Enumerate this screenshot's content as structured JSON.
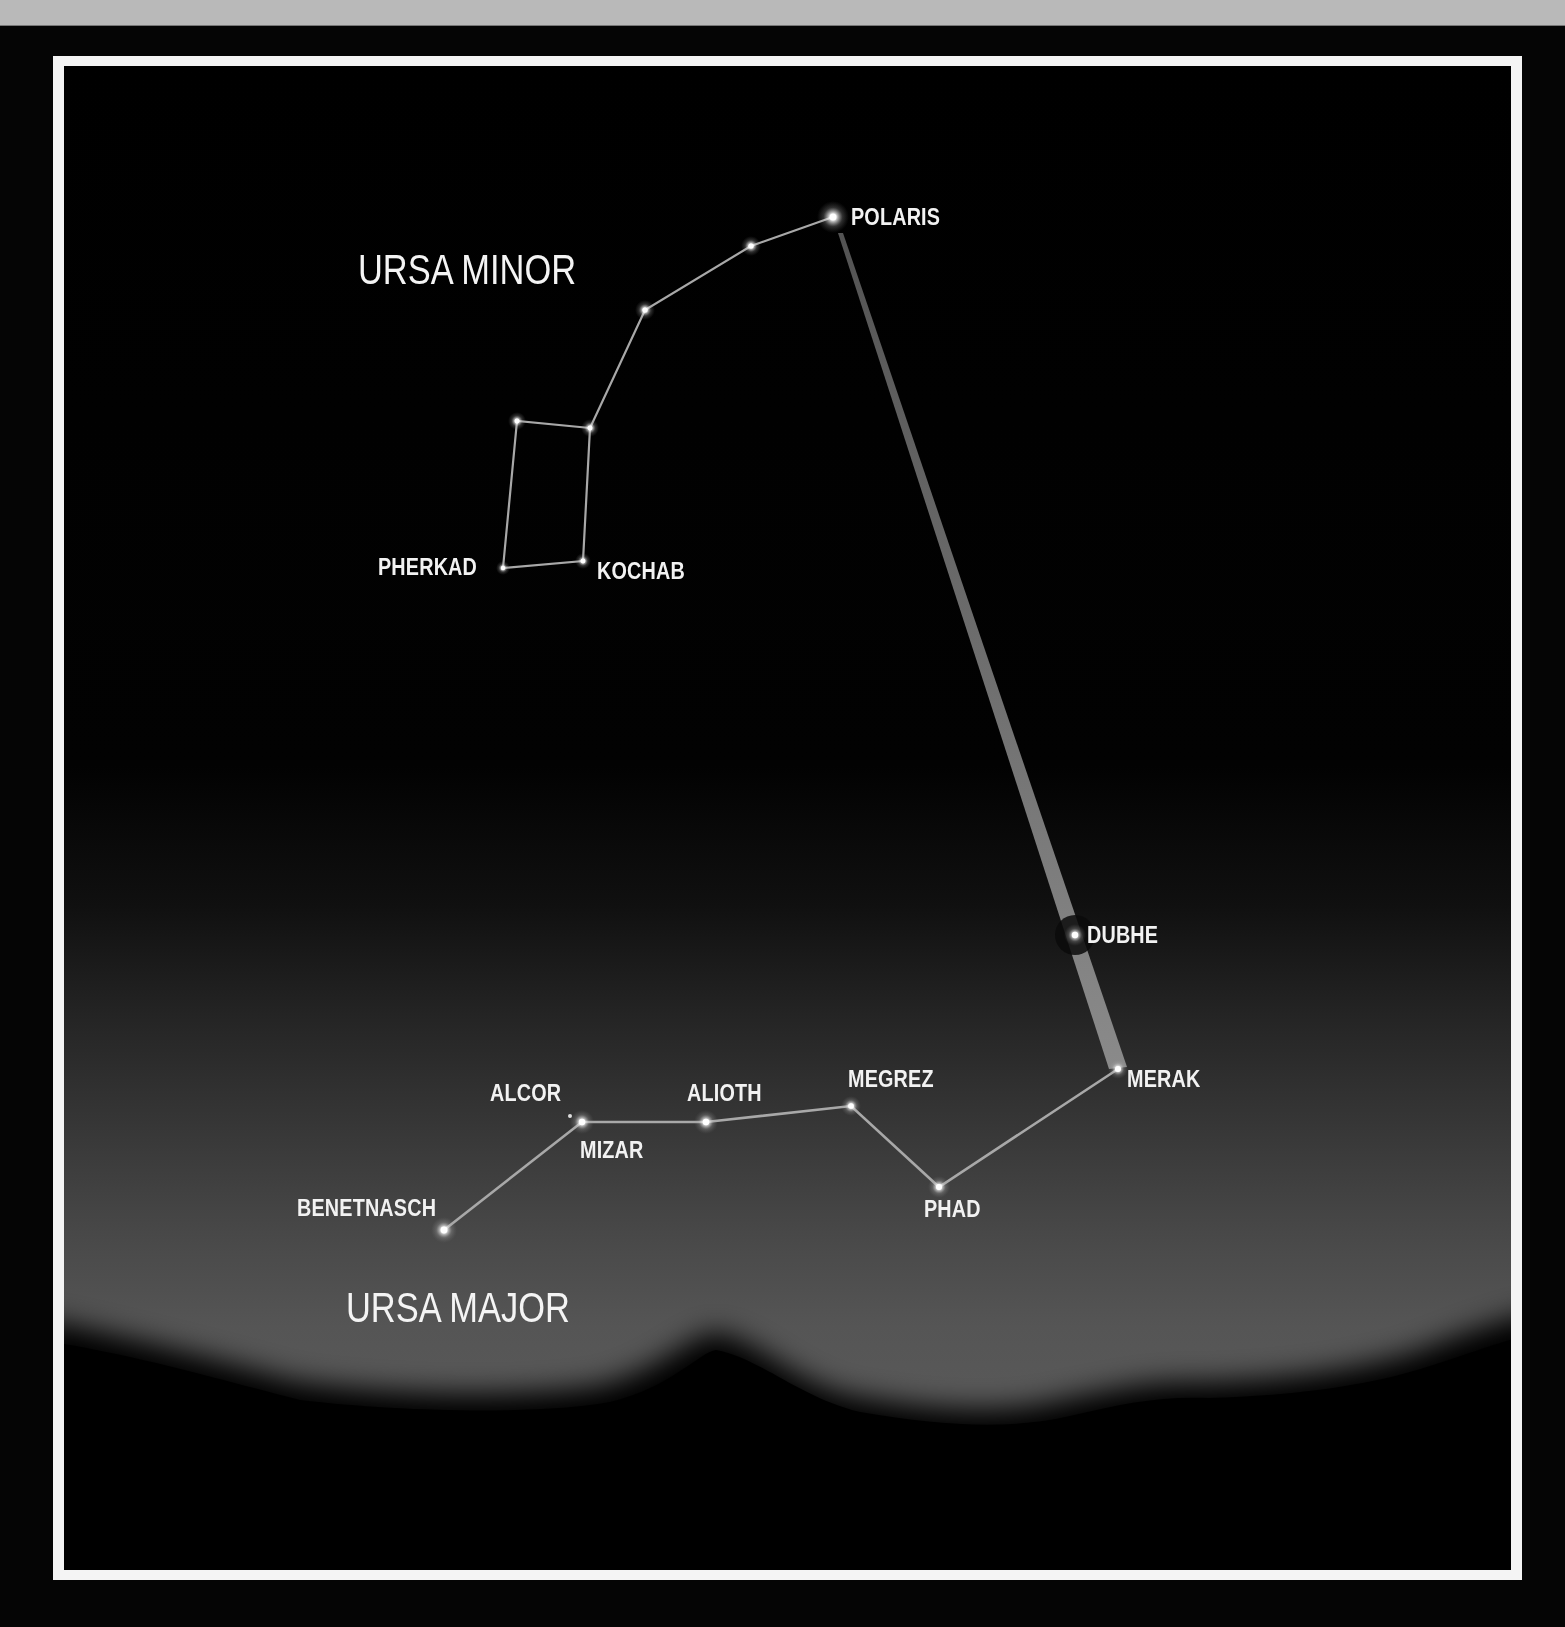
{
  "diagram": {
    "titles": {
      "ursa_minor": "URSA MINOR",
      "ursa_major": "URSA MAJOR"
    },
    "ursa_minor": {
      "stars": [
        {
          "id": "polaris",
          "label": "POLARIS",
          "x": 833,
          "y": 217
        },
        {
          "id": "um2",
          "label": "",
          "x": 751,
          "y": 246
        },
        {
          "id": "um3",
          "label": "",
          "x": 645,
          "y": 310
        },
        {
          "id": "um4",
          "label": "",
          "x": 590,
          "y": 428
        },
        {
          "id": "um5",
          "label": "",
          "x": 517,
          "y": 421
        },
        {
          "id": "kochab",
          "label": "KOCHAB",
          "x": 583,
          "y": 561
        },
        {
          "id": "pherkad",
          "label": "PHERKAD",
          "x": 503,
          "y": 568
        }
      ]
    },
    "ursa_major": {
      "stars": [
        {
          "id": "dubhe",
          "label": "DUBHE",
          "x": 1075,
          "y": 935
        },
        {
          "id": "merak",
          "label": "MERAK",
          "x": 1118,
          "y": 1069
        },
        {
          "id": "phad",
          "label": "PHAD",
          "x": 939,
          "y": 1187
        },
        {
          "id": "megrez",
          "label": "MEGREZ",
          "x": 851,
          "y": 1106
        },
        {
          "id": "alioth",
          "label": "ALIOTH",
          "x": 706,
          "y": 1122
        },
        {
          "id": "mizar",
          "label": "MIZAR",
          "x": 582,
          "y": 1122
        },
        {
          "id": "alcor",
          "label": "ALCOR",
          "x": 570,
          "y": 1116
        },
        {
          "id": "benetnasch",
          "label": "BENETNASCH",
          "x": 444,
          "y": 1230
        }
      ]
    },
    "pointer_line": {
      "from": "merak",
      "through": "dubhe",
      "to": "polaris"
    },
    "colors": {
      "sky_top": "#000000",
      "sky_horizon": "#585858",
      "label": "#f2f2f2",
      "frame": "#f4f4f4",
      "line": "#9a9a9a"
    }
  }
}
